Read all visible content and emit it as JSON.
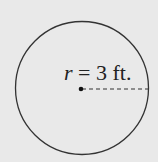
{
  "diagram": {
    "shape": "circle",
    "label": {
      "variable": "r",
      "equals": " = ",
      "value": "3 ft."
    },
    "radius_value": 3,
    "radius_unit": "ft.",
    "colors": {
      "background": "#e9e9e9",
      "stroke": "#333333"
    }
  }
}
